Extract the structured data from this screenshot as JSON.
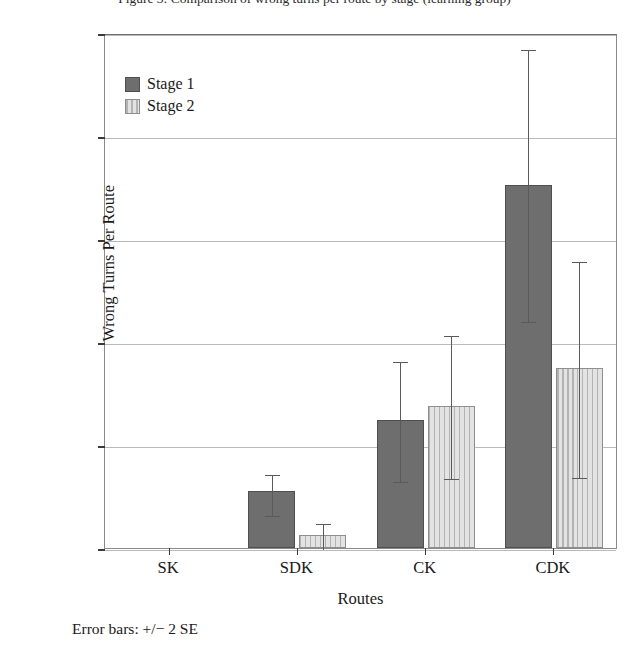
{
  "figure": {
    "top_caption_clipped": "Figure 3: Comparison of wrong turns per route by stage (learning group)",
    "footnote": "Error bars: +/− 2 SE"
  },
  "legend": {
    "position": "top-left-inside",
    "items": [
      {
        "label": "Stage 1",
        "color": "#6e6e6e",
        "pattern": "solid"
      },
      {
        "label": "Stage 2",
        "color": "#d2d2d2",
        "pattern": "vertical-lines"
      }
    ]
  },
  "chart_data": {
    "type": "bar",
    "title": "",
    "xlabel": "Routes",
    "ylabel": "Wrong Turns Per Route",
    "categories": [
      "SK",
      "SDK",
      "CK",
      "CDK"
    ],
    "ylim": [
      0,
      10
    ],
    "yticks": [
      0,
      2,
      4,
      6,
      8,
      10
    ],
    "ytick_labels": [
      "0.00",
      "2.00",
      "4.00",
      "6.00",
      "8.00",
      "10.00"
    ],
    "grid": true,
    "error_bar_note": "+/− 2 SE",
    "series": [
      {
        "name": "Stage 1",
        "color": "#6e6e6e",
        "values": [
          0.0,
          1.1,
          2.48,
          7.05
        ],
        "err_upper": [
          0.0,
          1.45,
          3.65,
          9.7
        ],
        "err_lower": [
          0.0,
          0.65,
          1.3,
          4.4
        ]
      },
      {
        "name": "Stage 2",
        "color": "#d2d2d2",
        "values": [
          0.0,
          0.25,
          2.75,
          3.5
        ],
        "err_upper": [
          0.0,
          0.5,
          4.15,
          5.6
        ],
        "err_lower": [
          0.0,
          0.0,
          1.35,
          1.37
        ]
      }
    ]
  }
}
